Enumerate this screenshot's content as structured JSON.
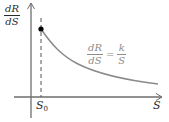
{
  "diagram": {
    "y_axis_label": {
      "numerator": "dR",
      "denominator": "dS"
    },
    "x_axis_label": "S",
    "marker_label": {
      "base": "S",
      "subscript": "0"
    },
    "equation": {
      "lhs": {
        "numerator": "dR",
        "denominator": "dS"
      },
      "operator": "=",
      "rhs": {
        "numerator": "k",
        "denominator": "S"
      }
    },
    "colors": {
      "axes": "#6e6e6e",
      "curve": "#8a8a8a",
      "point": "#000000",
      "dashed_line": "#555555",
      "equation_text": "#8c8c8c",
      "label_text": "#2a2a2a"
    }
  }
}
